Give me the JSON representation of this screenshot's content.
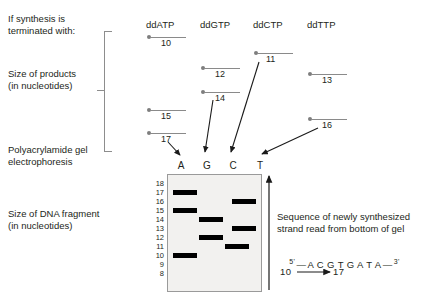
{
  "labels": {
    "termination": "If synthesis is\nterminated with:",
    "size_products": "Size of products\n(in nucleotides)",
    "gel_method": "Polyacrylamide gel\nelectrophoresis",
    "size_fragment": "Size of DNA fragment\n(in nucleotides)"
  },
  "columns": [
    {
      "name": "ddATP",
      "lane": "A"
    },
    {
      "name": "ddGTP",
      "lane": "G"
    },
    {
      "name": "ddCTP",
      "lane": "C"
    },
    {
      "name": "ddTTP",
      "lane": "T"
    }
  ],
  "products": [
    {
      "column": "ddATP",
      "value": "10"
    },
    {
      "column": "ddATP",
      "value": "15"
    },
    {
      "column": "ddATP",
      "value": "17"
    },
    {
      "column": "ddGTP",
      "value": "12"
    },
    {
      "column": "ddGTP",
      "value": "14"
    },
    {
      "column": "ddCTP",
      "value": "11"
    },
    {
      "column": "ddTTP",
      "value": "13"
    },
    {
      "column": "ddTTP",
      "value": "16"
    }
  ],
  "gel": {
    "ladder": [
      "18",
      "17",
      "16",
      "15",
      "14",
      "13",
      "12",
      "11",
      "10",
      "9",
      "8"
    ],
    "lanes": [
      "A",
      "G",
      "C",
      "T"
    ],
    "bands": [
      {
        "lane": "A",
        "size": "17"
      },
      {
        "lane": "A",
        "size": "15"
      },
      {
        "lane": "A",
        "size": "10"
      },
      {
        "lane": "G",
        "size": "14"
      },
      {
        "lane": "G",
        "size": "12"
      },
      {
        "lane": "C",
        "size": "11"
      },
      {
        "lane": "T",
        "size": "16"
      },
      {
        "lane": "T",
        "size": "13"
      }
    ]
  },
  "readout": {
    "caption": "Sequence of newly synthesized\nstrand read from bottom of gel",
    "five_prime": "5'",
    "three_prime": "3'",
    "sequence": "A C G T G A T A",
    "start_number": "10",
    "end_number": "17"
  },
  "colors": {
    "gel_fill": "#f2f1ef",
    "gel_border": "#9a9a9a",
    "band": "#000000",
    "marker": "#7e7e7e",
    "text": "#231f20"
  }
}
